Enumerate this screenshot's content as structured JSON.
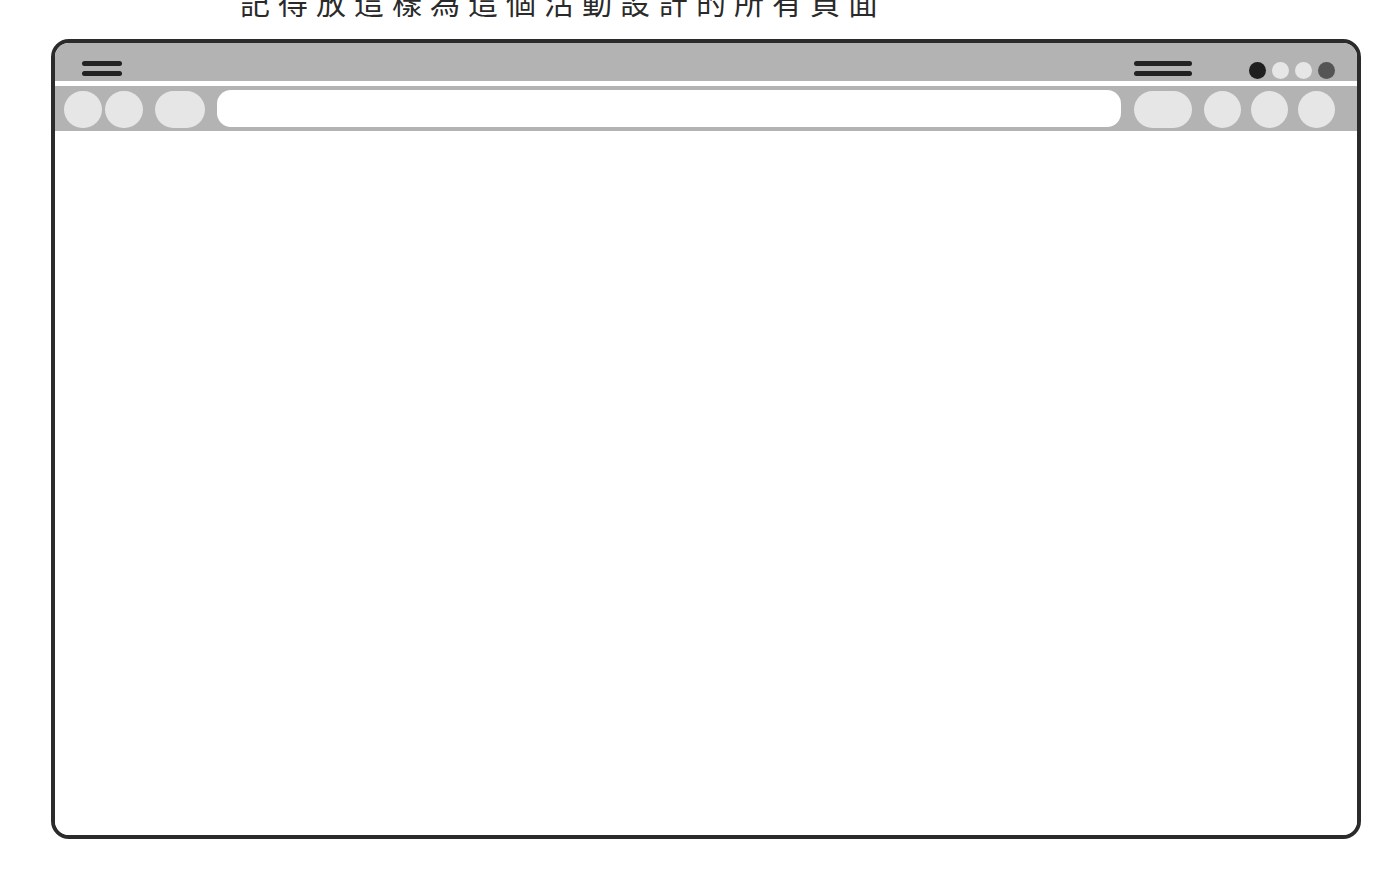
{
  "caption": {
    "text": "記得放這樣為這個活動設計的所有頁面"
  },
  "window": {
    "frame_color": "#2b2b2b",
    "chrome_color": "#b3b3b3",
    "button_color": "#e6e6e6",
    "titlebar": {
      "left_menu_icon": "hamburger-icon",
      "right_menu_icon": "hamburger-icon",
      "window_controls": [
        {
          "name": "control-dot-1",
          "color": "#1f1f1f"
        },
        {
          "name": "control-dot-2",
          "color": "#e6e6e6"
        },
        {
          "name": "control-dot-3",
          "color": "#e6e6e6"
        },
        {
          "name": "control-dot-4",
          "color": "#555555"
        }
      ]
    },
    "toolbar": {
      "left_buttons": [
        "back-button",
        "forward-button",
        "reload-button"
      ],
      "address_bar": {
        "value": "",
        "placeholder": ""
      },
      "right_buttons": [
        "extension-button",
        "bookmark-button",
        "profile-button",
        "settings-button"
      ]
    },
    "content": {
      "text": ""
    }
  }
}
